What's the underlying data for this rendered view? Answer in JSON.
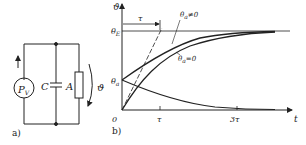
{
  "figure": {
    "panel_a": {
      "label": "a)",
      "source_label": "P",
      "source_sub": "V",
      "capacitor_label": "C",
      "resistor_label": "A",
      "temperature_label": "ϑ"
    },
    "panel_b": {
      "label": "b)",
      "y_axis_label": "ϑ",
      "x_axis_label": "t",
      "origin_label": "0",
      "theta_E_label": "θ",
      "theta_E_sub": "E",
      "theta_a_label": "θ",
      "theta_a_sub": "a",
      "tau_bracket_label": "τ",
      "curve_label_nonzero": "θ",
      "curve_label_nonzero_sub": "a",
      "curve_label_nonzero_suffix": "≠0",
      "curve_label_zero": "θ",
      "curve_label_zero_sub": "a",
      "curve_label_zero_suffix": "=0",
      "x_ticks": [
        "τ",
        "3τ"
      ]
    }
  },
  "colors": {
    "ink": "#222222",
    "background": "#ffffff"
  }
}
